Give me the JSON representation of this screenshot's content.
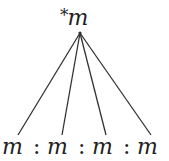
{
  "diagram": {
    "type": "tree",
    "root": {
      "label": "m",
      "prefix": "*"
    },
    "leaves": [
      {
        "label": "m"
      },
      {
        "label": "m"
      },
      {
        "label": "m"
      },
      {
        "label": "m"
      }
    ],
    "separators": [
      ":",
      ":",
      ":"
    ],
    "edge_color": "#333333",
    "text_color": "#222222"
  }
}
